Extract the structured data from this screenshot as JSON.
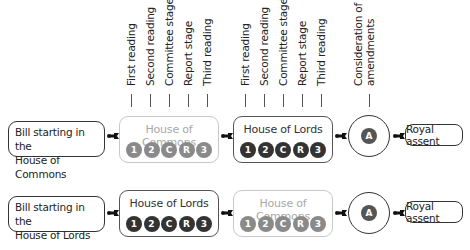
{
  "stage_labels": {
    "first_house": [
      "First reading",
      "Second reading",
      "Committee stage",
      "Report stage",
      "Third reading"
    ],
    "second_house": [
      "First reading",
      "Second reading",
      "Committee stage",
      "Report stage",
      "Third reading"
    ],
    "amendments": [
      "Consideration of",
      "amendments"
    ]
  },
  "stage_icons": [
    "1",
    "2",
    "C",
    "R",
    "3"
  ],
  "amendment_icon": "A",
  "rows": [
    {
      "start_line1": "Bill starting in the",
      "start_line2": "House of Commons",
      "house1": "House of Commons",
      "house1_faded": true,
      "house2": "House of Lords",
      "house2_faded": false,
      "end": "Royal assent"
    },
    {
      "start_line1": "Bill starting in the",
      "start_line2": "House of Lords",
      "house1": "House of Lords",
      "house1_faded": false,
      "house2": "House of Commons",
      "house2_faded": true,
      "end": "Royal assent"
    }
  ],
  "colors": {
    "active_stage": "#333333",
    "faded_stage": "#8a8a8a",
    "faded_border": "#c8c8c8"
  }
}
